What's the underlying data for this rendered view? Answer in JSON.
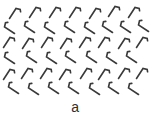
{
  "figure": {
    "label": "a",
    "background": "#ffffff",
    "stroke_color": "#3a3a3a",
    "pattern": {
      "glyph_types": {
        "A": "hook-mark-up-right",
        "B": "hook-mark-down-right"
      },
      "rows": [
        {
          "type": "A",
          "y": 5,
          "xs": [
            8,
            28,
            48,
            68,
            88,
            107,
            127
          ],
          "dy": [
            1,
            0,
            0,
            0,
            1,
            -1,
            0
          ]
        },
        {
          "type": "B",
          "y": 20,
          "xs": [
            2,
            22,
            42,
            62,
            82,
            100,
            118,
            136
          ],
          "dy": [
            1,
            0,
            1,
            0,
            1,
            0,
            0,
            -1
          ]
        },
        {
          "type": "A",
          "y": 35,
          "xs": [
            2,
            21,
            40,
            59,
            78,
            97,
            117,
            135
          ],
          "dy": [
            0,
            1,
            0,
            1,
            0,
            0,
            1,
            0
          ]
        },
        {
          "type": "B",
          "y": 50,
          "xs": [
            2,
            24,
            44,
            63,
            84,
            104,
            124
          ],
          "dy": [
            1,
            0,
            1,
            0,
            0,
            1,
            0
          ]
        },
        {
          "type": "A",
          "y": 66,
          "xs": [
            2,
            20,
            39,
            58,
            79,
            97,
            117,
            135
          ],
          "dy": [
            1,
            0,
            0,
            1,
            0,
            1,
            0,
            0
          ]
        },
        {
          "type": "B",
          "y": 81,
          "xs": [
            6,
            26,
            46,
            66,
            87,
            106,
            126
          ],
          "dy": [
            0,
            1,
            0,
            0,
            1,
            0,
            1
          ]
        }
      ]
    }
  }
}
